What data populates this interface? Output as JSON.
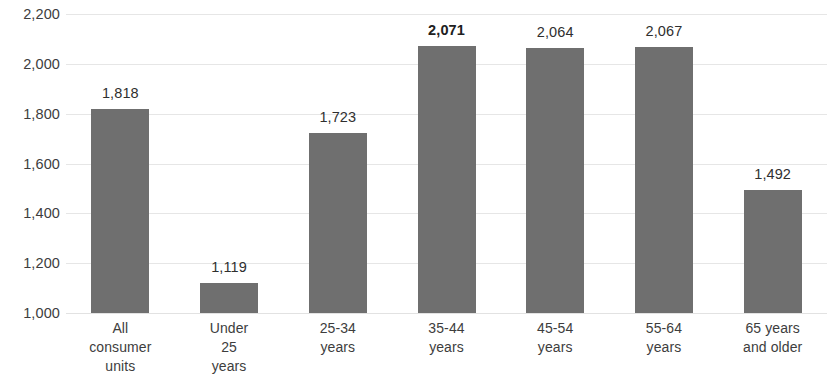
{
  "chart_data": {
    "type": "bar",
    "title": "",
    "subtitle": "",
    "xlabel": "",
    "ylabel": "",
    "ylim": [
      1000,
      2200
    ],
    "ytick_step": 200,
    "grid": true,
    "legend": false,
    "bar_color": "#6f6f6f",
    "gridline_color": "#e6e6e6",
    "text_color": "#3d3d3d",
    "categories": [
      "All consumer units",
      "Under 25 years",
      "25-34 years",
      "35-44 years",
      "45-54 years",
      "55-64 years",
      "65 years and older"
    ],
    "category_label_lines": [
      [
        "All",
        "consumer",
        "units"
      ],
      [
        "Under",
        "25",
        "years"
      ],
      [
        "25-34",
        "years"
      ],
      [
        "35-44",
        "years"
      ],
      [
        "45-54",
        "years"
      ],
      [
        "55-64",
        "years"
      ],
      [
        "65 years",
        "and older"
      ]
    ],
    "values": [
      1818,
      1119,
      1723,
      2071,
      2064,
      2067,
      1492
    ],
    "data_labels": [
      "1,818",
      "1,119",
      "1,723",
      "2,071",
      "2,064",
      "2,067",
      "1,492"
    ],
    "emphasized_index": 3,
    "ytick_labels": [
      "2,200",
      "2,000",
      "1,800",
      "1,600",
      "1,400",
      "1,200",
      "1,000"
    ],
    "ytick_values": [
      2200,
      2000,
      1800,
      1600,
      1400,
      1200,
      1000
    ]
  }
}
